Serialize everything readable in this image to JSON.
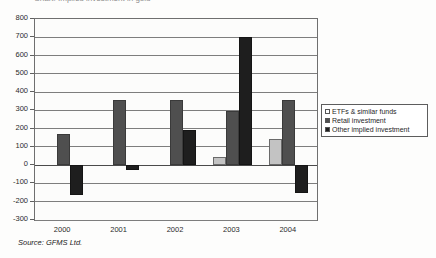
{
  "title_sliver": "Chart: Implied investment in gold",
  "source_note": "Source: GFMS Ltd.",
  "legend": {
    "position": "right-center-inside",
    "items": [
      {
        "key": "etf",
        "label": "ETFs  & similar funds"
      },
      {
        "key": "retail",
        "label": "Retail investment"
      },
      {
        "key": "other",
        "label": "Other implied investment"
      }
    ]
  },
  "colors": {
    "etf": "#c3c3c3",
    "retail": "#4f4f4f",
    "other": "#1e1e1e",
    "axis": "#6f6f6f",
    "grid": "#7d7d7d",
    "text": "#2b2b2b"
  },
  "chart_data": {
    "type": "bar",
    "title": "",
    "xlabel": "",
    "ylabel": "",
    "ylim": [
      -300,
      800
    ],
    "ytick_step": 100,
    "yticks": [
      800,
      700,
      600,
      500,
      400,
      300,
      200,
      100,
      0,
      -100,
      -200,
      -300
    ],
    "ytick_labels": [
      "800",
      "700",
      "600",
      "500",
      "400",
      "300",
      "200",
      "100",
      "0",
      "-100",
      "-200",
      "-300"
    ],
    "grid": true,
    "grid_axis": "y",
    "legend_position": "right",
    "categories": [
      "2000",
      "2001",
      "2002",
      "2003",
      "2004"
    ],
    "series": [
      {
        "name": "ETFs  & similar funds",
        "key": "etf",
        "values": [
          0,
          0,
          0,
          45,
          145
        ]
      },
      {
        "name": "Retail investment",
        "key": "retail",
        "values": [
          170,
          355,
          355,
          295,
          355
        ]
      },
      {
        "name": "Other implied investment",
        "key": "other",
        "values": [
          -165,
          -25,
          195,
          700,
          -155
        ]
      }
    ]
  }
}
